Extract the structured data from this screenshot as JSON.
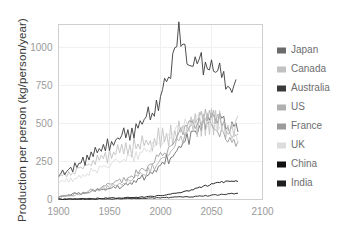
{
  "chart_data": {
    "type": "line",
    "title": "",
    "xlabel": "",
    "ylabel": "Production per person (kg/person/year)",
    "xlim": [
      1900,
      2100
    ],
    "ylim": [
      0,
      1150
    ],
    "xticks": [
      1900,
      1950,
      2000,
      2050,
      2100
    ],
    "xtick_labels": [
      "1900",
      "1950",
      "2000",
      "2050",
      "2100"
    ],
    "yticks": [
      0,
      250,
      500,
      750,
      1000
    ],
    "ytick_labels": [
      "0",
      "250",
      "500",
      "750",
      "1000"
    ],
    "grid": true,
    "legend_position": "right",
    "x_start": 1900,
    "x_end": 2070,
    "x_step": 2,
    "series": [
      {
        "name": "Japan",
        "color": "#6b6b6b",
        "values": [
          18,
          20,
          24,
          22,
          28,
          31,
          27,
          33,
          38,
          35,
          42,
          40,
          46,
          44,
          52,
          48,
          55,
          60,
          57,
          63,
          58,
          66,
          62,
          70,
          66,
          74,
          70,
          80,
          74,
          86,
          78,
          92,
          86,
          100,
          92,
          110,
          100,
          122,
          112,
          136,
          126,
          152,
          140,
          170,
          158,
          188,
          176,
          208,
          194,
          230,
          214,
          252,
          234,
          276,
          256,
          300,
          278,
          326,
          304,
          354,
          330,
          384,
          356,
          414,
          386,
          444,
          414,
          474,
          442,
          502,
          470,
          524,
          492,
          540,
          506,
          548,
          512,
          550,
          506,
          540,
          494,
          524,
          478,
          506,
          462,
          490,
          448,
          476,
          436
        ]
      },
      {
        "name": "Canada",
        "color": "#c2c2c2",
        "values": [
          150,
          166,
          158,
          176,
          164,
          184,
          172,
          196,
          180,
          208,
          190,
          222,
          200,
          236,
          212,
          252,
          224,
          268,
          234,
          282,
          244,
          296,
          252,
          308,
          260,
          320,
          268,
          330,
          274,
          340,
          282,
          350,
          288,
          360,
          296,
          370,
          302,
          380,
          310,
          390,
          318,
          400,
          326,
          412,
          334,
          422,
          342,
          434,
          350,
          444,
          358,
          456,
          366,
          466,
          376,
          478,
          386,
          490,
          396,
          502,
          406,
          514,
          416,
          526,
          426,
          538,
          436,
          548,
          444,
          556,
          450,
          560,
          452,
          560,
          450,
          556,
          446,
          548,
          440,
          540,
          434,
          532,
          430,
          526,
          426,
          524,
          426,
          528,
          530
        ]
      },
      {
        "name": "Australia",
        "color": "#3a3a3a",
        "values": [
          160,
          176,
          188,
          172,
          202,
          186,
          216,
          200,
          230,
          214,
          248,
          228,
          266,
          244,
          284,
          262,
          300,
          278,
          318,
          292,
          336,
          310,
          354,
          328,
          372,
          344,
          390,
          362,
          408,
          378,
          424,
          392,
          440,
          404,
          452,
          418,
          468,
          434,
          488,
          456,
          512,
          482,
          540,
          512,
          572,
          546,
          610,
          584,
          650,
          628,
          700,
          680,
          760,
          750,
          840,
          840,
          940,
          960,
          1060,
          1100,
          1040,
          980,
          1020,
          960,
          920,
          940,
          890,
          910,
          860,
          880,
          900,
          870,
          840,
          870,
          900,
          880,
          850,
          830,
          860,
          840,
          810,
          790,
          770,
          750,
          790,
          760,
          800,
          810
        ]
      },
      {
        "name": "US",
        "color": "#b0b0b0",
        "values": [
          12,
          14,
          16,
          18,
          22,
          20,
          26,
          24,
          30,
          28,
          36,
          34,
          42,
          40,
          48,
          46,
          54,
          52,
          60,
          58,
          66,
          64,
          74,
          70,
          82,
          78,
          90,
          86,
          98,
          94,
          106,
          102,
          116,
          112,
          126,
          122,
          138,
          134,
          150,
          146,
          164,
          160,
          180,
          176,
          198,
          194,
          216,
          212,
          238,
          234,
          260,
          256,
          286,
          282,
          312,
          308,
          340,
          336,
          370,
          366,
          402,
          398,
          434,
          430,
          466,
          462,
          496,
          492,
          522,
          518,
          542,
          538,
          552,
          548,
          552,
          546,
          544,
          536,
          528,
          518,
          506,
          494,
          482,
          468,
          456,
          442,
          430,
          418,
          408
        ]
      },
      {
        "name": "France",
        "color": "#9b9b9b",
        "values": [
          14,
          16,
          20,
          18,
          24,
          22,
          28,
          26,
          34,
          32,
          40,
          38,
          46,
          44,
          54,
          50,
          62,
          58,
          70,
          66,
          78,
          74,
          88,
          82,
          98,
          92,
          108,
          102,
          118,
          112,
          128,
          122,
          140,
          134,
          152,
          146,
          164,
          158,
          178,
          172,
          194,
          188,
          212,
          206,
          232,
          226,
          254,
          248,
          278,
          272,
          302,
          296,
          328,
          322,
          354,
          348,
          382,
          376,
          412,
          406,
          440,
          434,
          468,
          462,
          492,
          486,
          510,
          504,
          522,
          514,
          522,
          512,
          514,
          502,
          500,
          488,
          482,
          470,
          462,
          448,
          440,
          428,
          420,
          408,
          400,
          390,
          382,
          374,
          368
        ]
      },
      {
        "name": "UK",
        "color": "#dcdcdc",
        "values": [
          100,
          112,
          120,
          108,
          128,
          116,
          136,
          124,
          146,
          134,
          156,
          144,
          166,
          154,
          178,
          166,
          190,
          178,
          200,
          188,
          212,
          200,
          222,
          210,
          232,
          220,
          240,
          230,
          250,
          238,
          258,
          246,
          266,
          254,
          274,
          262,
          282,
          272,
          292,
          282,
          304,
          294,
          318,
          308,
          332,
          322,
          348,
          338,
          364,
          354,
          382,
          372,
          400,
          390,
          418,
          410,
          438,
          428,
          456,
          448,
          474,
          466,
          490,
          482,
          504,
          496,
          514,
          508,
          520,
          514,
          522,
          516,
          518,
          512,
          510,
          502,
          498,
          490,
          484,
          474,
          466,
          456,
          448,
          438,
          430,
          420,
          412,
          402,
          396
        ]
      },
      {
        "name": "China",
        "color": "#111111",
        "values": [
          2,
          2,
          2,
          3,
          3,
          3,
          3,
          4,
          4,
          4,
          4,
          5,
          5,
          5,
          5,
          6,
          6,
          6,
          6,
          7,
          7,
          7,
          8,
          8,
          8,
          9,
          9,
          9,
          10,
          10,
          10,
          11,
          11,
          12,
          12,
          13,
          13,
          14,
          14,
          15,
          16,
          16,
          17,
          18,
          19,
          20,
          21,
          22,
          23,
          24,
          26,
          27,
          29,
          30,
          32,
          34,
          36,
          38,
          41,
          43,
          46,
          49,
          52,
          55,
          58,
          62,
          65,
          69,
          73,
          77,
          81,
          85,
          89,
          93,
          97,
          101,
          104,
          107,
          110,
          112,
          114,
          116,
          117,
          118,
          119,
          119,
          120,
          120,
          120
        ]
      },
      {
        "name": "India",
        "color": "#1f1f1f",
        "values": [
          1,
          1,
          1,
          1,
          1,
          1,
          1,
          2,
          2,
          2,
          2,
          2,
          2,
          2,
          2,
          2,
          3,
          3,
          3,
          3,
          3,
          3,
          3,
          4,
          4,
          4,
          4,
          4,
          4,
          5,
          5,
          5,
          5,
          5,
          6,
          6,
          6,
          6,
          7,
          7,
          7,
          7,
          8,
          8,
          8,
          9,
          9,
          9,
          10,
          10,
          10,
          11,
          11,
          12,
          12,
          13,
          13,
          14,
          14,
          15,
          15,
          16,
          17,
          17,
          18,
          19,
          19,
          20,
          21,
          22,
          22,
          23,
          24,
          25,
          26,
          27,
          28,
          29,
          30,
          31,
          32,
          33,
          34,
          35,
          36,
          37,
          38,
          39,
          40
        ]
      }
    ]
  },
  "legend": {
    "items": [
      {
        "label": "Japan",
        "color": "#6b6b6b"
      },
      {
        "label": "Canada",
        "color": "#c2c2c2"
      },
      {
        "label": "Australia",
        "color": "#3a3a3a"
      },
      {
        "label": "US",
        "color": "#b0b0b0"
      },
      {
        "label": "France",
        "color": "#9b9b9b"
      },
      {
        "label": "UK",
        "color": "#dcdcdc"
      },
      {
        "label": "China",
        "color": "#111111"
      },
      {
        "label": "India",
        "color": "#1f1f1f"
      }
    ]
  }
}
